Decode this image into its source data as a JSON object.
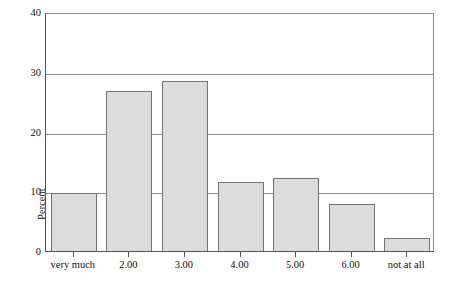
{
  "chart_data": {
    "type": "bar",
    "title": "",
    "xlabel": "",
    "ylabel": "Percent",
    "categories": [
      "very much",
      "2.00",
      "3.00",
      "4.00",
      "5.00",
      "6.00",
      "not at all"
    ],
    "values": [
      9.7,
      26.7,
      28.5,
      11.6,
      12.2,
      7.8,
      2.1
    ],
    "ylim": [
      0,
      40
    ],
    "yticks": [
      0,
      10,
      20,
      30,
      40
    ],
    "ytick_labels": [
      "0",
      "10",
      "20",
      "30",
      "40"
    ],
    "grid": true,
    "grid_axis": "y",
    "legend": false,
    "legend_position": "none",
    "bar_fill_color": "#dcdcdc",
    "bar_border_color": "#737373",
    "axis_color": "#555555",
    "gridline_color": "#8c8c8c",
    "background_color": "#ffffff"
  }
}
